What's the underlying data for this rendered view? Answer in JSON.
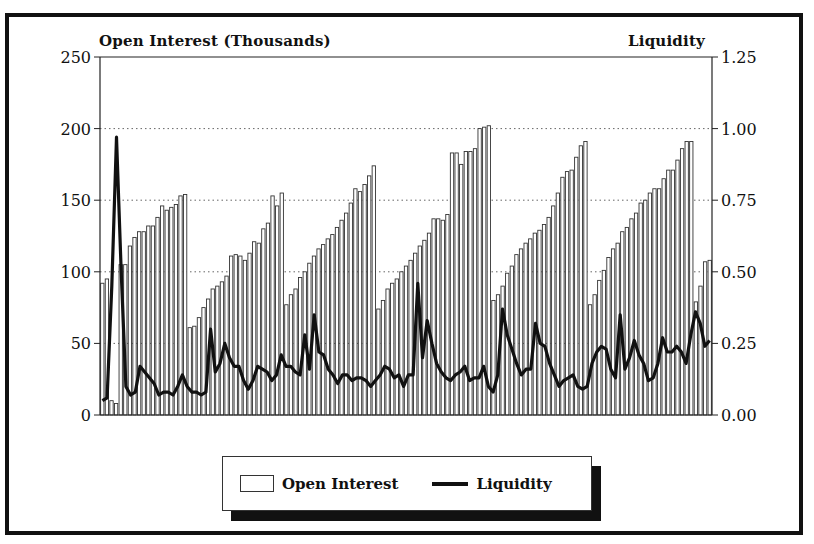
{
  "chart_data": {
    "type": "bar",
    "title": "",
    "left_axis": {
      "label": "Open Interest (Thousands)",
      "min": 0,
      "max": 250,
      "ticks": [
        0,
        50,
        100,
        150,
        200,
        250
      ],
      "tick_labels": [
        "0",
        "50",
        "100",
        "150",
        "200",
        "250"
      ]
    },
    "right_axis": {
      "label": "Liquidity",
      "min": 0,
      "max": 1.25,
      "ticks": [
        0,
        0.25,
        0.5,
        0.75,
        1.0,
        1.25
      ],
      "tick_labels": [
        "0.00",
        "0.25",
        "0.50",
        "0.75",
        "1.00",
        "1.25"
      ]
    },
    "grid": {
      "horizontal_dotted": [
        50,
        100,
        150,
        200
      ]
    },
    "legend": {
      "position": "bottom-center",
      "entries": [
        "Open Interest",
        "Liquidity"
      ]
    },
    "series": [
      {
        "name": "Open Interest",
        "type": "bar",
        "axis": "left",
        "values": [
          92,
          95,
          10,
          8,
          105,
          105,
          118,
          124,
          128,
          128,
          132,
          132,
          138,
          146,
          143,
          145,
          147,
          153,
          154,
          61,
          62,
          68,
          75,
          81,
          88,
          90,
          93,
          97,
          111,
          112,
          111,
          108,
          113,
          121,
          120,
          130,
          134,
          153,
          146,
          155,
          77,
          84,
          88,
          96,
          100,
          106,
          111,
          116,
          119,
          123,
          126,
          131,
          136,
          141,
          148,
          158,
          156,
          161,
          167,
          174,
          74,
          80,
          88,
          92,
          95,
          100,
          104,
          108,
          113,
          118,
          122,
          127,
          137,
          137,
          136,
          140,
          183,
          183,
          175,
          184,
          184,
          186,
          200,
          201,
          202,
          80,
          84,
          90,
          99,
          104,
          112,
          116,
          120,
          123,
          127,
          129,
          133,
          138,
          146,
          155,
          166,
          170,
          171,
          180,
          188,
          191,
          77,
          84,
          94,
          101,
          110,
          116,
          120,
          128,
          131,
          137,
          141,
          148,
          150,
          155,
          158,
          158,
          165,
          171,
          171,
          178,
          186,
          191,
          191,
          79,
          90,
          107,
          108
        ]
      },
      {
        "name": "Liquidity",
        "type": "line",
        "axis": "right",
        "values": [
          0.05,
          0.06,
          0.45,
          0.97,
          0.5,
          0.1,
          0.07,
          0.08,
          0.17,
          0.15,
          0.13,
          0.11,
          0.07,
          0.08,
          0.08,
          0.07,
          0.1,
          0.14,
          0.1,
          0.08,
          0.08,
          0.07,
          0.08,
          0.3,
          0.15,
          0.18,
          0.25,
          0.2,
          0.17,
          0.17,
          0.12,
          0.09,
          0.12,
          0.17,
          0.16,
          0.15,
          0.12,
          0.14,
          0.21,
          0.17,
          0.17,
          0.15,
          0.14,
          0.28,
          0.16,
          0.35,
          0.22,
          0.21,
          0.16,
          0.14,
          0.11,
          0.14,
          0.14,
          0.12,
          0.13,
          0.13,
          0.12,
          0.1,
          0.12,
          0.14,
          0.17,
          0.16,
          0.13,
          0.14,
          0.1,
          0.14,
          0.14,
          0.46,
          0.2,
          0.33,
          0.25,
          0.18,
          0.15,
          0.13,
          0.12,
          0.14,
          0.15,
          0.17,
          0.12,
          0.13,
          0.13,
          0.17,
          0.1,
          0.08,
          0.14,
          0.37,
          0.28,
          0.23,
          0.18,
          0.14,
          0.16,
          0.16,
          0.32,
          0.25,
          0.24,
          0.18,
          0.14,
          0.1,
          0.12,
          0.13,
          0.14,
          0.1,
          0.09,
          0.1,
          0.18,
          0.22,
          0.24,
          0.23,
          0.16,
          0.13,
          0.35,
          0.16,
          0.2,
          0.26,
          0.21,
          0.18,
          0.12,
          0.13,
          0.18,
          0.27,
          0.22,
          0.22,
          0.24,
          0.22,
          0.18,
          0.28,
          0.36,
          0.32,
          0.24,
          0.26
        ]
      }
    ]
  },
  "ui": {
    "left_axis_title": "Open Interest (Thousands)",
    "right_axis_title": "Liquidity",
    "legend": {
      "open_interest": "Open Interest",
      "liquidity": "Liquidity"
    },
    "colors": {
      "bar_fill": "#ffffff",
      "bar_stroke": "#333333",
      "line": "#111111",
      "grid": "#666666",
      "frame": "#111111"
    }
  }
}
